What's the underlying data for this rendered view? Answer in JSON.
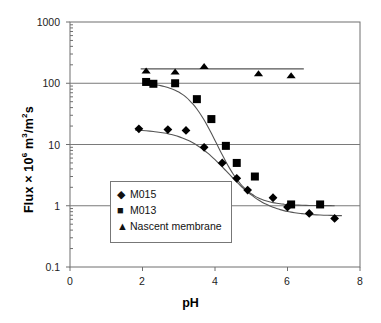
{
  "chart_data": {
    "type": "scatter",
    "title": "",
    "xlabel": "pH",
    "ylabel": "Flux × 10⁶ m³/m²s",
    "ylabel_parts": {
      "prefix": "Flux × 10",
      "exp1": "6",
      "mid": " m",
      "exp2": "3",
      "slash": "/m",
      "exp3": "2",
      "suffix": "s"
    },
    "xlim": [
      0,
      8
    ],
    "ylim": [
      0.1,
      1000
    ],
    "yscale": "log",
    "xscale": "linear",
    "xticks": [
      0,
      2,
      4,
      6,
      8
    ],
    "xtick_labels": [
      "0",
      "2",
      "4",
      "6",
      "8"
    ],
    "yticks": [
      0.1,
      1,
      10,
      100,
      1000
    ],
    "ytick_labels": [
      "0.1",
      "1",
      "10",
      "100",
      "1000"
    ],
    "grid": "horizontal-major",
    "legend_position": "lower-left-inside",
    "series": [
      {
        "name": "M015",
        "marker": "diamond",
        "color": "#000000",
        "points": [
          {
            "x": 1.9,
            "y": 18
          },
          {
            "x": 2.7,
            "y": 17.5
          },
          {
            "x": 3.2,
            "y": 17
          },
          {
            "x": 3.7,
            "y": 9.0
          },
          {
            "x": 4.2,
            "y": 5.0
          },
          {
            "x": 4.6,
            "y": 2.8
          },
          {
            "x": 4.9,
            "y": 1.8
          },
          {
            "x": 5.6,
            "y": 1.35
          },
          {
            "x": 6.0,
            "y": 0.95
          },
          {
            "x": 6.6,
            "y": 0.75
          },
          {
            "x": 7.3,
            "y": 0.62
          }
        ],
        "fit": "sigmoid decreasing from 18 to 0.7"
      },
      {
        "name": "M013",
        "marker": "square",
        "color": "#000000",
        "points": [
          {
            "x": 2.1,
            "y": 105
          },
          {
            "x": 2.3,
            "y": 98
          },
          {
            "x": 2.9,
            "y": 100
          },
          {
            "x": 3.5,
            "y": 55
          },
          {
            "x": 3.9,
            "y": 26
          },
          {
            "x": 4.3,
            "y": 9.5
          },
          {
            "x": 4.6,
            "y": 5.0
          },
          {
            "x": 5.1,
            "y": 3.0
          },
          {
            "x": 6.1,
            "y": 1.05
          },
          {
            "x": 6.9,
            "y": 1.05
          }
        ],
        "fit": "sigmoid decreasing from 105 to 1.0"
      },
      {
        "name": "Nascent membrane",
        "marker": "triangle",
        "color": "#000000",
        "points": [
          {
            "x": 2.1,
            "y": 155
          },
          {
            "x": 2.9,
            "y": 150
          },
          {
            "x": 3.7,
            "y": 185
          },
          {
            "x": 5.2,
            "y": 140
          },
          {
            "x": 6.1,
            "y": 130
          }
        ],
        "fit": "flat line near 170"
      }
    ]
  },
  "axes": {
    "xlabel": "pH",
    "ylabel_prefix": "Flux × 10",
    "ylabel_exp1": "6",
    "ylabel_mid": " m",
    "ylabel_exp2": "3",
    "ylabel_slash": "/m",
    "ylabel_exp3": "2",
    "ylabel_suffix": "s",
    "ytick_labels": [
      "1000",
      "100",
      "10",
      "1",
      "0.1"
    ],
    "xtick_labels": [
      "0",
      "2",
      "4",
      "6",
      "8"
    ]
  },
  "legend": {
    "items": [
      {
        "marker": "◆",
        "label": "M015",
        "marker_name": "diamond-marker"
      },
      {
        "marker": "■",
        "label": "M013",
        "marker_name": "square-marker"
      },
      {
        "marker": "▲",
        "label": "Nascent membrane",
        "marker_name": "triangle-marker"
      }
    ]
  },
  "style": {
    "axis_color": "#6f6f6f",
    "grid_color": "#7a7a7a",
    "marker_color": "#000000",
    "curve_color": "#555555",
    "background": "#ffffff"
  }
}
